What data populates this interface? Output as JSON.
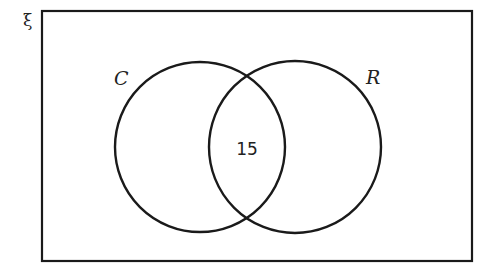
{
  "diagram": {
    "type": "venn",
    "universal_symbol": "ξ",
    "sets": [
      {
        "name": "C",
        "label": "C"
      },
      {
        "name": "R",
        "label": "R"
      }
    ],
    "regions": {
      "C_only": "",
      "C_and_R": "15",
      "R_only": "",
      "outside": ""
    },
    "colors": {
      "stroke": "#1a1a1a",
      "background": "#ffffff"
    }
  }
}
